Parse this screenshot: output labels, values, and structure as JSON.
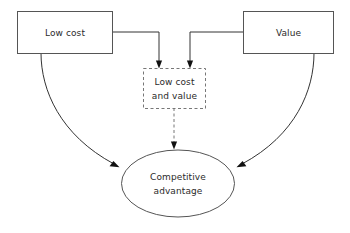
{
  "diagram": {
    "background_color": "#ffffff",
    "stroke_color": "#333333",
    "dashed_stroke_color": "#777777",
    "text_color": "#2b2b2b",
    "width": 350,
    "height": 233
  },
  "nodes": {
    "low_cost": {
      "label": "Low cost",
      "shape": "rectangle",
      "border": "solid",
      "x": 17,
      "y": 11,
      "width": 95,
      "height": 42
    },
    "value": {
      "label": "Value",
      "shape": "rectangle",
      "border": "solid",
      "x": 243,
      "y": 11,
      "width": 90,
      "height": 42
    },
    "low_cost_and_value": {
      "label_line1": "Low cost",
      "label_line2": "and value",
      "shape": "rectangle",
      "border": "dashed",
      "x": 143,
      "y": 68,
      "width": 62,
      "height": 40
    },
    "competitive_advantage": {
      "label_line1": "Competitive",
      "label_line2": "advantage",
      "shape": "ellipse",
      "border": "solid",
      "cx": 178,
      "cy": 183,
      "rx": 57,
      "ry": 34
    }
  },
  "connectors": [
    {
      "name": "low-cost-to-combined",
      "from": "low_cost",
      "to": "low_cost_and_value",
      "style": "elbow",
      "arrow": "end"
    },
    {
      "name": "value-to-combined",
      "from": "value",
      "to": "low_cost_and_value",
      "style": "elbow",
      "arrow": "end"
    },
    {
      "name": "combined-to-advantage",
      "from": "low_cost_and_value",
      "to": "competitive_advantage",
      "style": "straight-dashed",
      "arrow": "end"
    },
    {
      "name": "low-cost-to-advantage",
      "from": "low_cost",
      "to": "competitive_advantage",
      "style": "curve",
      "arrow": "end"
    },
    {
      "name": "value-to-advantage",
      "from": "value",
      "to": "competitive_advantage",
      "style": "curve",
      "arrow": "end"
    }
  ]
}
